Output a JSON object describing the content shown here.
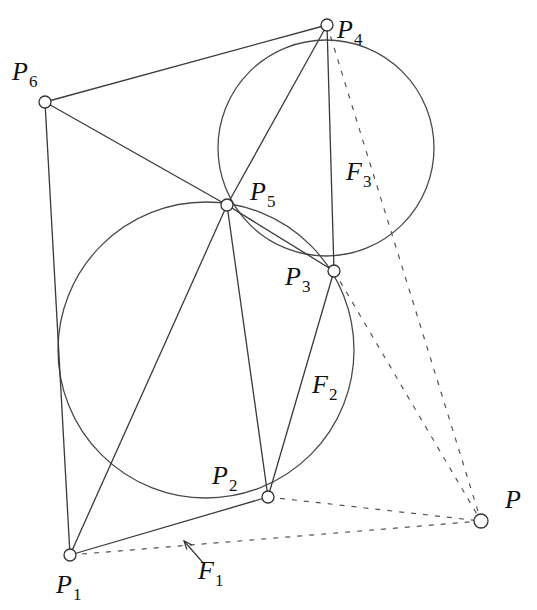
{
  "diagram": {
    "title": "",
    "points": [
      {
        "id": "P1",
        "label": "P",
        "sub": "1",
        "x": 70,
        "y": 555,
        "lx": 56,
        "ly": 593
      },
      {
        "id": "P2",
        "label": "P",
        "sub": "2",
        "x": 268,
        "y": 497,
        "lx": 212,
        "ly": 484
      },
      {
        "id": "P3",
        "label": "P",
        "sub": "3",
        "x": 334,
        "y": 271,
        "lx": 285,
        "ly": 285
      },
      {
        "id": "P4",
        "label": "P",
        "sub": "4",
        "x": 327,
        "y": 25,
        "lx": 337,
        "ly": 38
      },
      {
        "id": "P5",
        "label": "P",
        "sub": "5",
        "x": 227,
        "y": 205,
        "lx": 250,
        "ly": 200
      },
      {
        "id": "P6",
        "label": "P",
        "sub": "6",
        "x": 45,
        "y": 102,
        "lx": 12,
        "ly": 80
      },
      {
        "id": "P",
        "label": "P",
        "sub": "",
        "x": 481,
        "y": 521,
        "lx": 505,
        "ly": 508
      }
    ],
    "faces": [
      {
        "id": "F1",
        "label": "F",
        "sub": "1",
        "lx": 198,
        "ly": 579
      },
      {
        "id": "F2",
        "label": "F",
        "sub": "2",
        "lx": 312,
        "ly": 393
      },
      {
        "id": "F3",
        "label": "F",
        "sub": "3",
        "lx": 346,
        "ly": 180
      }
    ],
    "edges": [
      [
        "P6",
        "P4"
      ],
      [
        "P6",
        "P5"
      ],
      [
        "P6",
        "P1"
      ],
      [
        "P4",
        "P5"
      ],
      [
        "P4",
        "P3"
      ],
      [
        "P5",
        "P3"
      ],
      [
        "P5",
        "P1"
      ],
      [
        "P5",
        "P2"
      ],
      [
        "P3",
        "P2"
      ],
      [
        "P1",
        "P2"
      ]
    ],
    "dashed_edges": [
      [
        "P4",
        "P"
      ],
      [
        "P3",
        "P"
      ],
      [
        "P2",
        "P"
      ],
      [
        "P1",
        "P"
      ]
    ],
    "circles": [
      {
        "id": "circumcircle-F2",
        "cx": 206,
        "cy": 350,
        "r": 148
      },
      {
        "id": "circumcircle-F3",
        "cx": 326,
        "cy": 148,
        "r": 108
      }
    ],
    "arrow": {
      "points_to": "F1",
      "from": [
        205,
        565
      ],
      "to": [
        184,
        541
      ]
    }
  }
}
